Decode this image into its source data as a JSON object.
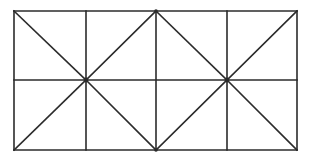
{
  "figure": {
    "background_color": "#ffffff",
    "line_color": "#2b2b2b",
    "line_width": 1.6,
    "canvas": {
      "width": 312,
      "height": 161
    }
  },
  "chart_data": {
    "type": "diagram",
    "xlabel": "",
    "ylabel": "",
    "xlim": [
      0,
      312
    ],
    "ylim": [
      0,
      161
    ],
    "grid": false,
    "legend": "none",
    "bounds": {
      "left": 14,
      "top": 11,
      "right": 297,
      "bottom": 150
    },
    "columns": 4,
    "rows": 2,
    "vertical_lines_x": [
      14,
      86,
      156,
      227,
      297
    ],
    "horizontal_lines_y": [
      11,
      80,
      150
    ],
    "grid_segments": [
      {
        "name": "outer-top",
        "x1": 14,
        "y1": 11,
        "x2": 297,
        "y2": 11
      },
      {
        "name": "outer-bottom",
        "x1": 14,
        "y1": 150,
        "x2": 297,
        "y2": 150
      },
      {
        "name": "outer-left",
        "x1": 14,
        "y1": 11,
        "x2": 14,
        "y2": 150
      },
      {
        "name": "outer-right",
        "x1": 297,
        "y1": 11,
        "x2": 297,
        "y2": 150
      },
      {
        "name": "middle-horizontal",
        "x1": 14,
        "y1": 80,
        "x2": 297,
        "y2": 80
      },
      {
        "name": "vertical-1",
        "x1": 86,
        "y1": 11,
        "x2": 86,
        "y2": 150
      },
      {
        "name": "vertical-2",
        "x1": 156,
        "y1": 11,
        "x2": 156,
        "y2": 150
      },
      {
        "name": "vertical-3",
        "x1": 227,
        "y1": 11,
        "x2": 227,
        "y2": 150
      }
    ],
    "diagonals": [
      {
        "name": "cell-r1c1-diagonal",
        "direction": "top-left-to-bottom-right",
        "x1": 14,
        "y1": 11,
        "x2": 86,
        "y2": 80
      },
      {
        "name": "cell-r1c2-diagonal",
        "direction": "bottom-left-to-top-right",
        "x1": 86,
        "y1": 80,
        "x2": 156,
        "y2": 11
      },
      {
        "name": "cell-r1c3-diagonal",
        "direction": "top-left-to-bottom-right",
        "x1": 156,
        "y1": 11,
        "x2": 227,
        "y2": 80
      },
      {
        "name": "cell-r1c4-diagonal",
        "direction": "bottom-left-to-top-right",
        "x1": 227,
        "y1": 80,
        "x2": 297,
        "y2": 11
      },
      {
        "name": "cell-r2c1-diagonal",
        "direction": "bottom-left-to-top-right",
        "x1": 14,
        "y1": 150,
        "x2": 86,
        "y2": 80
      },
      {
        "name": "cell-r2c2-diagonal",
        "direction": "top-left-to-bottom-right",
        "x1": 86,
        "y1": 80,
        "x2": 156,
        "y2": 150
      },
      {
        "name": "cell-r2c3-diagonal",
        "direction": "bottom-left-to-top-right",
        "x1": 156,
        "y1": 150,
        "x2": 227,
        "y2": 80
      },
      {
        "name": "cell-r2c4-diagonal",
        "direction": "top-left-to-bottom-right",
        "x1": 227,
        "y1": 80,
        "x2": 297,
        "y2": 150
      }
    ],
    "junction_points": [
      {
        "name": "left-star-junction",
        "x": 86,
        "y": 80,
        "radius": 2.4,
        "rays": 8
      },
      {
        "name": "right-star-junction",
        "x": 227,
        "y": 80,
        "radius": 2.4,
        "rays": 8
      },
      {
        "name": "top-middle-junction",
        "x": 156,
        "y": 11,
        "radius": 1.8,
        "rays": 4
      },
      {
        "name": "bottom-middle-junction",
        "x": 156,
        "y": 150,
        "radius": 1.8,
        "rays": 4
      }
    ]
  }
}
